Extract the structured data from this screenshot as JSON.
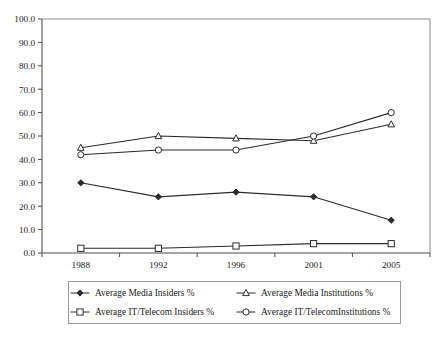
{
  "chart_data": {
    "type": "line",
    "title": "",
    "xlabel": "",
    "ylabel": "",
    "categories": [
      "1988",
      "1992",
      "1996",
      "2001",
      "2005"
    ],
    "ylim": [
      0,
      100
    ],
    "ytick_labels": [
      "0.0",
      "10.0",
      "20.0",
      "30.0",
      "40.0",
      "50.0",
      "60.0",
      "70.0",
      "80.0",
      "90.0",
      "100.0"
    ],
    "ytick_values": [
      0,
      10,
      20,
      30,
      40,
      50,
      60,
      70,
      80,
      90,
      100
    ],
    "grid": false,
    "legend_position": "bottom",
    "series": [
      {
        "name": "Average Media Insiders %",
        "marker": "diamond-solid",
        "values": [
          30,
          24,
          26,
          24,
          14
        ]
      },
      {
        "name": "Average Media Institutions %",
        "marker": "triangle-open",
        "values": [
          45,
          50,
          49,
          48,
          55
        ]
      },
      {
        "name": "Average IT/Telecom Insiders %",
        "marker": "square-open",
        "values": [
          2,
          2,
          3,
          4,
          4
        ]
      },
      {
        "name": "Average IT/TelecomInstitutions %",
        "marker": "circle-open",
        "values": [
          42,
          44,
          44,
          50,
          60
        ]
      }
    ]
  },
  "colors": {
    "line": "#2b2b2b",
    "axis": "#4a4a4a",
    "frame": "#8a8a8a",
    "text": "#1a1a1a",
    "background": "#ffffff"
  },
  "legend": {
    "entries": [
      "Average Media Insiders %",
      "Average Media Institutions %",
      "Average IT/Telecom Insiders %",
      "Average IT/TelecomInstitutions %"
    ]
  }
}
